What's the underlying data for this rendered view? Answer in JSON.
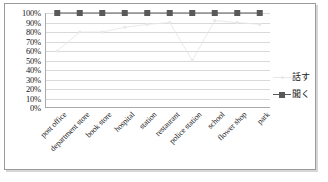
{
  "chart_data": {
    "type": "line",
    "title": "",
    "xlabel": "",
    "ylabel": "",
    "ylim": [
      0,
      100
    ],
    "ytick_labels": [
      "100%",
      "90%",
      "80%",
      "70%",
      "60%",
      "50%",
      "40%",
      "30%",
      "20%",
      "10%",
      "0%"
    ],
    "ytick_values": [
      100,
      90,
      80,
      70,
      60,
      50,
      40,
      30,
      20,
      10,
      0
    ],
    "grid": true,
    "legend_position": "right",
    "categories": [
      "post office",
      "department store",
      "book store",
      "hospital",
      "station",
      "restaurant",
      "police station",
      "school",
      "flower shop",
      "park"
    ],
    "series": [
      {
        "name": "話す",
        "color": "#e8e8e8",
        "marker": "dot",
        "values": [
          60,
          80,
          80,
          85,
          88,
          90,
          50,
          92,
          90,
          88
        ]
      },
      {
        "name": "聞く",
        "color": "#595959",
        "marker": "square",
        "values": [
          100,
          100,
          100,
          100,
          100,
          100,
          100,
          100,
          100,
          100
        ]
      }
    ]
  },
  "legend": {
    "items": [
      {
        "label": "話す"
      },
      {
        "label": "聞く"
      }
    ]
  },
  "colors": {
    "frame_border": "#9a9a9a",
    "gridline": "#d9d9d9",
    "axis": "#aaaaaa",
    "series_speak": "#e8e8e8",
    "series_listen": "#595959",
    "text": "#1a1a1a"
  }
}
